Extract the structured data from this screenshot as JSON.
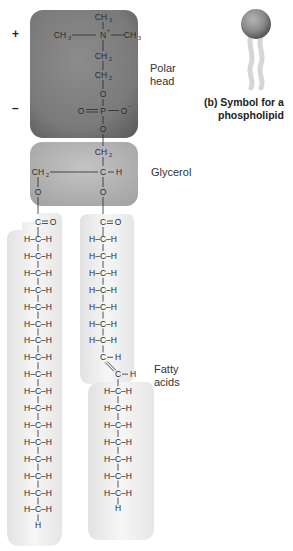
{
  "labels": {
    "polar_head": [
      "Polar",
      "head"
    ],
    "glycerol": "Glycerol",
    "fatty_acids": [
      "Fatty",
      "acids"
    ],
    "symbol_caption": [
      "(b) Symbol for a",
      "phospholipid"
    ],
    "plus_charge": "+",
    "minus_charge": "–"
  },
  "colors": {
    "polar_head_box": "#7c7c7c",
    "glycerol_box": "#b8b8b8",
    "tail_box": "#f1f1f1",
    "sphere": "#8a8a8a",
    "tail_symbol": "#dcdcdc"
  },
  "polar_head": {
    "choline": [
      "CH3",
      "CH3–N+–CH3",
      "CH2",
      "CH2"
    ],
    "phosphate": [
      "O",
      "O=P–O−",
      "O"
    ]
  },
  "glycerol": {
    "top": "CH2",
    "middle_left": "CH2",
    "middle_right": "C–H",
    "ester_oxygens": [
      "O",
      "O"
    ]
  },
  "fatty_acid_saturated": {
    "carbonyl": "C=O",
    "methylene_rows": 17,
    "row_label": "H–C–H",
    "terminal": "H"
  },
  "fatty_acid_unsaturated": {
    "carbonyl": "C=O",
    "methylene_rows_before_double_bond": 7,
    "double_bond_rows": [
      "C–H",
      "C–H"
    ],
    "methylene_rows_after_double_bond": 7,
    "row_label": "H–C–H",
    "terminal": "H"
  }
}
